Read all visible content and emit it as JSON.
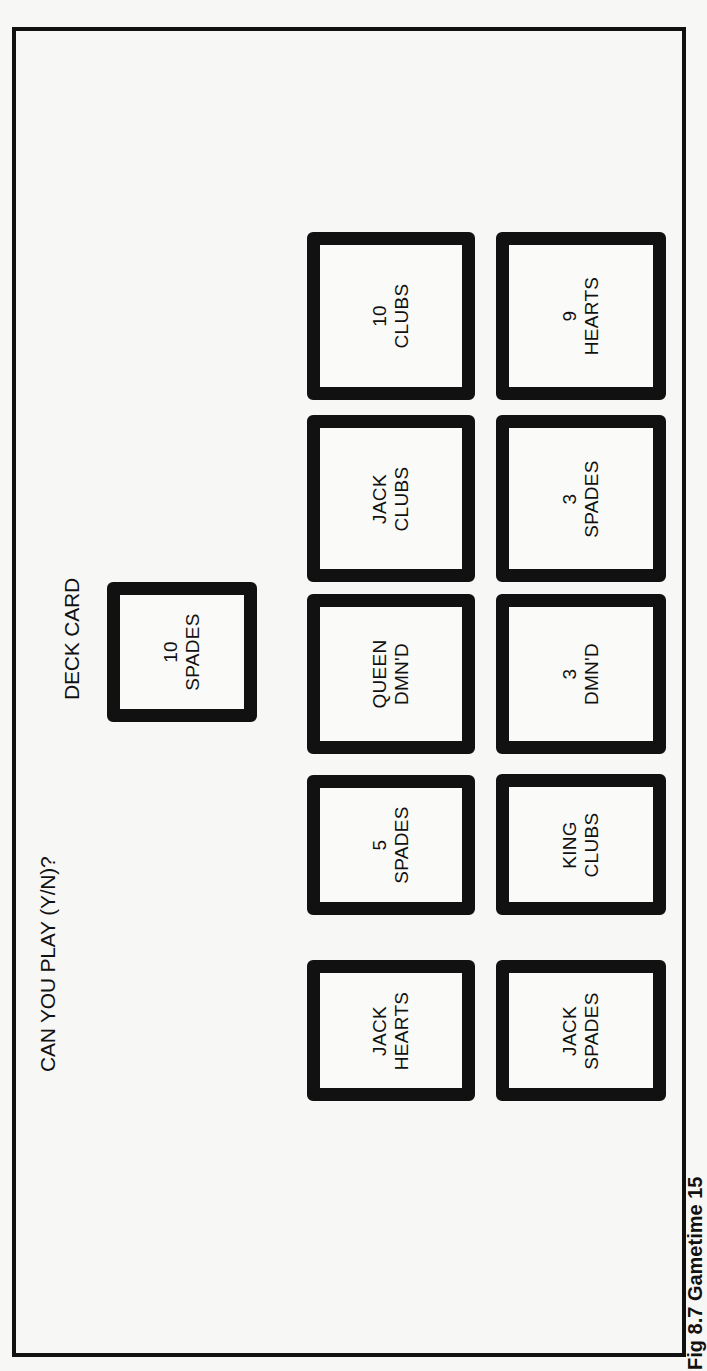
{
  "screen": {
    "prompt": "CAN YOU PLAY (Y/N)?",
    "deck_label": "DECK CARD",
    "deck_card": {
      "rank": "10",
      "suit": "SPADES"
    },
    "hand": [
      {
        "rank": "10",
        "suit": "CLUBS"
      },
      {
        "rank": "9",
        "suit": "HEARTS"
      },
      {
        "rank": "JACK",
        "suit": "CLUBS"
      },
      {
        "rank": "3",
        "suit": "SPADES"
      },
      {
        "rank": "QUEEN",
        "suit": "DMN'D"
      },
      {
        "rank": "3",
        "suit": "DMN'D"
      },
      {
        "rank": "5",
        "suit": "SPADES"
      },
      {
        "rank": "KING",
        "suit": "CLUBS"
      },
      {
        "rank": "JACK",
        "suit": "HEARTS"
      },
      {
        "rank": "JACK",
        "suit": "SPADES"
      }
    ]
  },
  "caption": "Fig 8.7 Gametime 15"
}
